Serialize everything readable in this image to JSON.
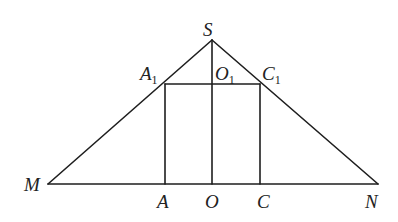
{
  "diagram": {
    "type": "geometry-figure",
    "points": {
      "S": {
        "label": "S",
        "x": 212,
        "y": 40
      },
      "M": {
        "label": "M",
        "x": 48,
        "y": 184
      },
      "N": {
        "label": "N",
        "x": 378,
        "y": 184
      },
      "A1": {
        "label": "A",
        "sub": "1",
        "x": 165,
        "y": 84
      },
      "O1": {
        "label": "O",
        "sub": "1",
        "x": 212,
        "y": 84
      },
      "C1": {
        "label": "C",
        "sub": "1",
        "x": 260,
        "y": 84
      },
      "A": {
        "label": "A",
        "x": 165,
        "y": 184
      },
      "O": {
        "label": "O",
        "x": 212,
        "y": 184
      },
      "C": {
        "label": "C",
        "x": 260,
        "y": 184
      }
    },
    "segments": [
      [
        "S",
        "M"
      ],
      [
        "S",
        "N"
      ],
      [
        "M",
        "N"
      ],
      [
        "S",
        "O"
      ],
      [
        "A1",
        "C1"
      ],
      [
        "A1",
        "A"
      ],
      [
        "C1",
        "C"
      ]
    ],
    "stroke_color": "#1e1e1e",
    "background": "#ffffff"
  }
}
